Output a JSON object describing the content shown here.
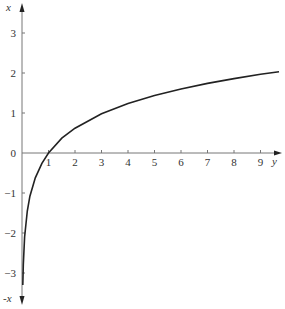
{
  "chart_data": {
    "type": "line",
    "title": "",
    "xlabel": "y",
    "ylabel": "x",
    "ylabel_negative": "-x",
    "x_ticks": [
      "1",
      "2",
      "3",
      "4",
      "5",
      "6",
      "7",
      "8",
      "9"
    ],
    "y_ticks": [
      "3",
      "2",
      "1",
      "0",
      "-1",
      "-2",
      "-3"
    ],
    "xlim": [
      0,
      9.8
    ],
    "ylim": [
      -3.6,
      3.6
    ],
    "grid": false,
    "legend": null,
    "series": [
      {
        "name": "curve",
        "x": [
          0.03,
          0.05,
          0.1,
          0.2,
          0.3,
          0.5,
          0.75,
          1,
          1.5,
          2,
          3,
          4,
          5,
          6,
          7,
          8,
          9,
          9.7
        ],
        "values": [
          -3.3,
          -2.8,
          -2.1,
          -1.45,
          -1.08,
          -0.62,
          -0.26,
          0.0,
          0.37,
          0.62,
          0.98,
          1.24,
          1.44,
          1.6,
          1.74,
          1.86,
          1.97,
          2.03
        ]
      }
    ],
    "colors": {
      "axis": "#777777",
      "curve": "#222222"
    }
  }
}
